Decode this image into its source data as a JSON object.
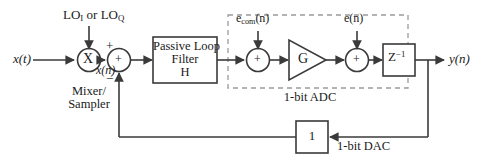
{
  "figure": {
    "type": "block-diagram",
    "domain": "signal-processing",
    "background": "#ffffff",
    "line_color": "#3a3a3a",
    "text_color": "#1a1a1a",
    "dashed_color": "#9a9a9a"
  },
  "signals": {
    "input": "x(t)",
    "mixer_output": "x(n)",
    "lo": {
      "base": "LO",
      "sub_i": "I",
      "joiner": " or ",
      "sub_q": "Q"
    },
    "noise_com": {
      "base": "e",
      "sub": "com",
      "arg": "(n)"
    },
    "noise_e": {
      "base": "e",
      "arg": "(n)"
    },
    "output": "y(n)"
  },
  "blocks": {
    "mixer": {
      "symbol": "X",
      "caption_line1": "Mixer/",
      "caption_line2": "Sampler"
    },
    "summer_input": {
      "symbol": "+",
      "sign_plus": "+",
      "sign_minus": "−"
    },
    "loop_filter": {
      "line1": "Passive Loop",
      "line2": "Filter",
      "line3": "H"
    },
    "summer_com": {
      "symbol": "+"
    },
    "gain": {
      "symbol": "G"
    },
    "summer_e": {
      "symbol": "+"
    },
    "delay": {
      "base": "Z",
      "exponent": "−1"
    },
    "dac": {
      "symbol": "1"
    }
  },
  "annotations": {
    "adc_group": "1-bit ADC",
    "dac_label": "1-bit DAC"
  }
}
